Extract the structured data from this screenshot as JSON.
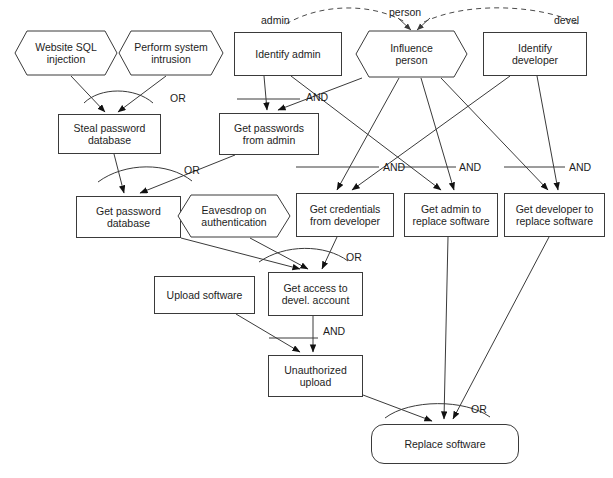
{
  "diagram": {
    "type": "attack-tree",
    "nodes": [
      {
        "id": "website-sql-injection",
        "label": "Website SQL\ninjection",
        "shape": "hexagon",
        "x": 14,
        "y": 30,
        "w": 104,
        "h": 46
      },
      {
        "id": "perform-system-intrusion",
        "label": "Perform system\nintrusion",
        "shape": "hexagon",
        "x": 118,
        "y": 30,
        "w": 106,
        "h": 46
      },
      {
        "id": "identify-admin",
        "label": "Identify admin",
        "shape": "rect",
        "x": 234,
        "y": 32,
        "w": 108,
        "h": 44
      },
      {
        "id": "influence-person",
        "label": "Influence\nperson",
        "shape": "hexagon",
        "x": 355,
        "y": 30,
        "w": 113,
        "h": 48
      },
      {
        "id": "identify-developer",
        "label": "Identify\ndeveloper",
        "shape": "rect",
        "x": 483,
        "y": 32,
        "w": 104,
        "h": 44
      },
      {
        "id": "steal-password-database",
        "label": "Steal password\ndatabase",
        "shape": "rect",
        "x": 58,
        "y": 114,
        "w": 103,
        "h": 40
      },
      {
        "id": "get-passwords-from-admin",
        "label": "Get passwords\nfrom admin",
        "shape": "rect",
        "x": 219,
        "y": 113,
        "w": 100,
        "h": 42
      },
      {
        "id": "get-password-database",
        "label": "Get password\ndatabase",
        "shape": "rect",
        "x": 76,
        "y": 196,
        "w": 105,
        "h": 42
      },
      {
        "id": "eavesdrop-on-authentication",
        "label": "Eavesdrop on\nauthentication",
        "shape": "hexagon",
        "x": 177,
        "y": 194,
        "w": 114,
        "h": 44
      },
      {
        "id": "get-credentials-from-developer",
        "label": "Get credentials\nfrom developer",
        "shape": "rect",
        "x": 296,
        "y": 193,
        "w": 98,
        "h": 44
      },
      {
        "id": "get-admin-to-replace-software",
        "label": "Get admin to\nreplace software",
        "shape": "rect",
        "x": 404,
        "y": 193,
        "w": 94,
        "h": 44
      },
      {
        "id": "get-developer-to-replace-software",
        "label": "Get developer to\nreplace software",
        "shape": "rect",
        "x": 504,
        "y": 193,
        "w": 101,
        "h": 44
      },
      {
        "id": "upload-software",
        "label": "Upload software",
        "shape": "rect",
        "x": 154,
        "y": 276,
        "w": 101,
        "h": 38
      },
      {
        "id": "get-access-to-devel-account",
        "label": "Get access to\ndevel. account",
        "shape": "rect",
        "x": 268,
        "y": 272,
        "w": 95,
        "h": 44
      },
      {
        "id": "unauthorized-upload",
        "label": "Unauthorized\nupload",
        "shape": "rect",
        "x": 268,
        "y": 355,
        "w": 95,
        "h": 42
      },
      {
        "id": "replace-software",
        "label": "Replace software",
        "shape": "rounded",
        "x": 371,
        "y": 424,
        "w": 148,
        "h": 40
      }
    ],
    "gates": [
      {
        "id": "gate-steal-password-database",
        "type": "OR",
        "label": "OR",
        "label_x": 170,
        "label_y": 100
      },
      {
        "id": "gate-get-passwords-from-admin",
        "type": "AND",
        "label": "AND",
        "label_x": 306,
        "label_y": 98
      },
      {
        "id": "gate-get-password-database",
        "type": "OR",
        "label": "OR",
        "label_x": 184,
        "label_y": 171
      },
      {
        "id": "gate-get-credentials-from-developer",
        "type": "AND",
        "label": "AND",
        "label_x": 385,
        "label_y": 168
      },
      {
        "id": "gate-get-admin-to-replace-software",
        "type": "AND",
        "label": "AND",
        "label_x": 462,
        "label_y": 168
      },
      {
        "id": "gate-get-developer-to-replace-software",
        "type": "AND",
        "label": "AND",
        "label_x": 571,
        "label_y": 168
      },
      {
        "id": "gate-get-access-to-devel-account",
        "type": "OR",
        "label": "OR",
        "label_x": 344,
        "label_y": 257
      },
      {
        "id": "gate-unauthorized-upload",
        "type": "AND",
        "label": "AND",
        "label_x": 323,
        "label_y": 330
      },
      {
        "id": "gate-replace-software",
        "type": "OR",
        "label": "OR",
        "label_x": 473,
        "label_y": 408
      }
    ],
    "role_labels": [
      {
        "id": "role-admin",
        "text": "admin",
        "x": 261,
        "y": 17
      },
      {
        "id": "role-person",
        "text": "person",
        "x": 391,
        "y": 8
      },
      {
        "id": "role-devel",
        "text": "devel",
        "x": 556,
        "y": 17
      }
    ],
    "legend": {
      "or_gate": "OR",
      "and_gate": "AND"
    }
  }
}
